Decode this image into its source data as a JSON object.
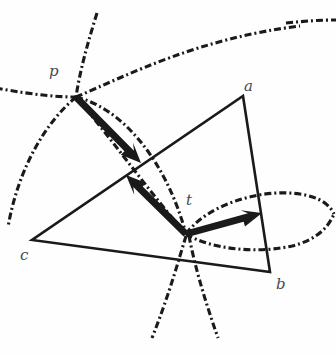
{
  "figure": {
    "width": 336,
    "height": 355,
    "background_color": "#fefefe",
    "ink_color": "#1a1a1a",
    "label_color": "#4a4a4a"
  },
  "labels": {
    "p": "p",
    "a": "a",
    "b": "b",
    "c": "c",
    "t": "t"
  },
  "points": {
    "p": {
      "x": 76,
      "y": 97
    },
    "a": {
      "x": 243,
      "y": 96
    },
    "b": {
      "x": 270,
      "y": 272
    },
    "c": {
      "x": 32,
      "y": 240
    },
    "t": {
      "x": 186,
      "y": 234
    }
  },
  "label_positions": {
    "p": {
      "x": 49,
      "y": 64
    },
    "a": {
      "x": 244,
      "y": 79
    },
    "b": {
      "x": 276,
      "y": 277
    },
    "c": {
      "x": 20,
      "y": 248
    },
    "t": {
      "x": 186,
      "y": 193
    }
  },
  "triangle": {
    "name": "triangle-abc",
    "vertices": [
      "a",
      "b",
      "c"
    ],
    "stroke_width": 2.6,
    "stroke": "#1a1a1a"
  },
  "arrows": [
    {
      "name": "arrow-p-to-mid",
      "from": {
        "x": 76,
        "y": 97
      },
      "to": {
        "x": 141,
        "y": 163
      },
      "stroke_width": 7,
      "head_length": 20,
      "head_width": 17
    },
    {
      "name": "arrow-t-to-upper-left",
      "from": {
        "x": 186,
        "y": 234
      },
      "to": {
        "x": 126,
        "y": 175
      },
      "stroke_width": 7,
      "head_length": 20,
      "head_width": 17
    },
    {
      "name": "arrow-t-to-right",
      "from": {
        "x": 186,
        "y": 234
      },
      "to": {
        "x": 262,
        "y": 213
      },
      "stroke_width": 7,
      "head_length": 20,
      "head_width": 17
    }
  ],
  "curves": [
    {
      "name": "arc-p-left-horizontal",
      "d": "M -4 88 C 18 92 48 97 76 97"
    },
    {
      "name": "arc-p-upper-right-long",
      "d": "M 76 97 C 130 74 200 38 300 26"
    },
    {
      "name": "arc-top-right-fragment",
      "d": "M 286 23 C 305 21 322 20 336 20"
    },
    {
      "name": "arc-p-vertical-up",
      "d": "M 97 13 C 88 42 80 70 76 97"
    },
    {
      "name": "arc-p-down-left",
      "d": "M 76 97 C 44 124 18 170 8 227"
    },
    {
      "name": "arc-p-to-t-upper",
      "d": "M 76 97 C 122 108 166 160 186 234"
    },
    {
      "name": "arc-p-to-t-lower",
      "d": "M 76 97 C 108 134 146 188 186 234"
    },
    {
      "name": "arc-lens-t-upper",
      "d": "M 186 234 C 206 206 258 188 300 194 C 320 197 330 205 334 214"
    },
    {
      "name": "arc-lens-t-lower",
      "d": "M 186 234 C 210 249 256 254 292 246 C 316 240 328 228 334 214"
    },
    {
      "name": "arc-t-down-left",
      "d": "M 186 236 C 178 262 170 292 152 338"
    },
    {
      "name": "arc-t-down-right",
      "d": "M 189 236 C 194 262 202 292 218 338"
    }
  ],
  "dash_pattern": {
    "description": "dash-dot stroke",
    "dasharray": "7 3 2 3",
    "stroke_width": 3.1
  }
}
